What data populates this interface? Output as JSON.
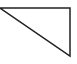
{
  "diagram": {
    "shape": "right-triangle",
    "vertices": [
      [
        0,
        8
      ],
      [
        70,
        8
      ],
      [
        70,
        56
      ]
    ],
    "stroke_color": "#222222",
    "stroke_width": 1.5,
    "fill": "none",
    "background": "#ffffff"
  }
}
